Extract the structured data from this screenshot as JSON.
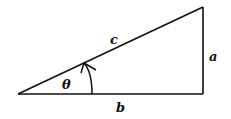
{
  "diagram": {
    "type": "right-triangle",
    "labels": {
      "hypotenuse": "c",
      "opposite": "a",
      "adjacent": "b",
      "angle": "θ"
    },
    "colors": {
      "stroke": "#111111",
      "background": "#ffffff"
    }
  }
}
